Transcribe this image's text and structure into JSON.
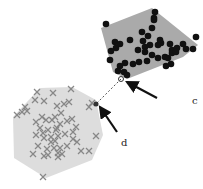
{
  "diagram": {
    "type": "convex hull separation",
    "clusters": [
      {
        "name": "dots",
        "marker": "circle",
        "hull_color": "#aaaaaa",
        "marker_color": "#111111",
        "hull": [
          [
            101,
            28
          ],
          [
            152,
            8
          ],
          [
            198,
            45
          ],
          [
            183,
            57
          ],
          [
            127,
            79
          ],
          [
            113,
            72
          ]
        ],
        "points": [
          [
            106,
            24
          ],
          [
            155,
            12
          ],
          [
            154,
            18
          ],
          [
            154,
            20
          ],
          [
            196,
            37
          ],
          [
            183,
            44
          ],
          [
            193,
            49
          ],
          [
            115,
            42
          ],
          [
            116,
            48
          ],
          [
            120,
            44
          ],
          [
            111,
            51
          ],
          [
            130,
            40
          ],
          [
            142,
            32
          ],
          [
            148,
            36
          ],
          [
            143,
            41
          ],
          [
            150,
            45
          ],
          [
            145,
            47
          ],
          [
            138,
            50
          ],
          [
            145,
            52
          ],
          [
            152,
            55
          ],
          [
            158,
            45
          ],
          [
            161,
            43
          ],
          [
            170,
            44
          ],
          [
            172,
            50
          ],
          [
            177,
            48
          ],
          [
            172,
            53
          ],
          [
            165,
            57
          ],
          [
            158,
            58
          ],
          [
            147,
            61
          ],
          [
            139,
            62
          ],
          [
            133,
            64
          ],
          [
            125,
            63
          ],
          [
            120,
            66
          ],
          [
            118,
            71
          ],
          [
            124,
            72
          ],
          [
            127,
            75
          ],
          [
            110,
            60
          ],
          [
            152,
            28
          ],
          [
            160,
            40
          ],
          [
            168,
            58
          ],
          [
            171,
            64
          ],
          [
            166,
            66
          ],
          [
            176,
            52
          ],
          [
            186,
            49
          ]
        ]
      },
      {
        "name": "crosses",
        "marker": "x",
        "hull_color": "#dddddd",
        "marker_color": "#888888",
        "hull": [
          [
            40,
            88
          ],
          [
            72,
            87
          ],
          [
            96,
            100
          ],
          [
            103,
            135
          ],
          [
            92,
            160
          ],
          [
            46,
            178
          ],
          [
            14,
            158
          ],
          [
            13,
            117
          ]
        ],
        "points": [
          [
            37,
            92
          ],
          [
            53,
            93
          ],
          [
            71,
            89
          ],
          [
            35,
            100
          ],
          [
            44,
            101
          ],
          [
            57,
            106
          ],
          [
            64,
            104
          ],
          [
            69,
            102
          ],
          [
            17,
            115
          ],
          [
            22,
            112
          ],
          [
            27,
            111
          ],
          [
            25,
            107
          ],
          [
            89,
            107
          ],
          [
            92,
            103
          ],
          [
            42,
            117
          ],
          [
            46,
            120
          ],
          [
            52,
            120
          ],
          [
            61,
            113
          ],
          [
            55,
            117
          ],
          [
            36,
            122
          ],
          [
            40,
            128
          ],
          [
            48,
            130
          ],
          [
            56,
            130
          ],
          [
            60,
            124
          ],
          [
            67,
            121
          ],
          [
            72,
            119
          ],
          [
            36,
            135
          ],
          [
            44,
            138
          ],
          [
            51,
            137
          ],
          [
            58,
            136
          ],
          [
            65,
            134
          ],
          [
            73,
            132
          ],
          [
            76,
            127
          ],
          [
            38,
            146
          ],
          [
            47,
            149
          ],
          [
            54,
            148
          ],
          [
            60,
            148
          ],
          [
            67,
            146
          ],
          [
            73,
            139
          ],
          [
            51,
            142
          ],
          [
            55,
            141
          ],
          [
            43,
            133
          ],
          [
            57,
            128
          ],
          [
            96,
            136
          ],
          [
            77,
            142
          ],
          [
            81,
            151
          ],
          [
            89,
            151
          ],
          [
            33,
            154
          ],
          [
            44,
            156
          ],
          [
            48,
            155
          ],
          [
            58,
            153
          ],
          [
            62,
            154
          ],
          [
            58,
            157
          ],
          [
            43,
            177
          ]
        ]
      }
    ],
    "connector": {
      "from": [
        121,
        79
      ],
      "to": [
        96,
        104
      ],
      "style": "dashed"
    },
    "labels": [
      {
        "text": "c",
        "x": 192,
        "y": 104
      },
      {
        "text": "d",
        "x": 121,
        "y": 146
      }
    ],
    "arrows": [
      {
        "from": [
          157,
          98
        ],
        "to": [
          127,
          82
        ]
      },
      {
        "from": [
          117,
          132
        ],
        "to": [
          100,
          107
        ]
      }
    ]
  }
}
